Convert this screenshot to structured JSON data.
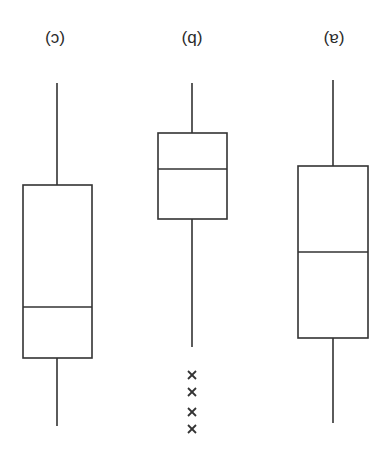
{
  "figure": {
    "orientation": "rotated-180",
    "stroke_color": "#333333",
    "background": "#ffffff"
  },
  "labels": {
    "left": "(c)",
    "middle": "(b)",
    "right": "(a)"
  },
  "chart_data": {
    "type": "boxplot",
    "title": "",
    "xlabel": "",
    "ylabel": "",
    "note": "Image displayed rotated 180 degrees; values on relative 0-100 scale (no axis shown). Upright order is (a), (b), (c) from left to right.",
    "categories": [
      "(a)",
      "(b)",
      "(c)"
    ],
    "series": [
      {
        "name": "(a)",
        "min": 0,
        "q1": 25,
        "median": 49,
        "q3": 74,
        "max": 98,
        "outliers": []
      },
      {
        "name": "(b)",
        "min": 1,
        "q1": 15,
        "median": 25,
        "q3": 40,
        "max": 76,
        "outliers": [
          84,
          89,
          95,
          100
        ]
      },
      {
        "name": "(c)",
        "min": 1,
        "q1": 30,
        "median": 65,
        "q3": 79,
        "max": 99,
        "outliers": []
      }
    ],
    "outlier_marker": "x",
    "grid": false,
    "legend": false
  },
  "render": {
    "boxes": [
      {
        "id": "c",
        "cx": 57,
        "x": 23,
        "w": 69,
        "whisker_top": 83,
        "box_top": 185,
        "median": 307,
        "box_bottom": 358,
        "whisker_bottom": 426,
        "outliers": []
      },
      {
        "id": "b",
        "cx": 192,
        "x": 158,
        "w": 69,
        "whisker_top": 83,
        "box_top": 133,
        "median": 169,
        "box_bottom": 219,
        "whisker_bottom": 347,
        "outliers": [
          375,
          392,
          412,
          429
        ]
      },
      {
        "id": "a",
        "cx": 333,
        "x": 298,
        "w": 70,
        "whisker_top": 80,
        "box_top": 166,
        "median": 252,
        "box_bottom": 338,
        "whisker_bottom": 423,
        "outliers": []
      }
    ]
  }
}
